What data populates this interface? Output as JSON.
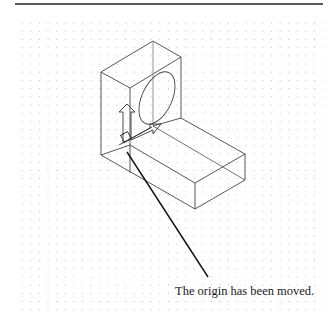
{
  "figure": {
    "caption": "The origin has been moved.",
    "colors": {
      "line": "#444444",
      "leader": "#111111",
      "grid_dot": "#b8b8b8",
      "rule": "#5a5a5a"
    }
  }
}
